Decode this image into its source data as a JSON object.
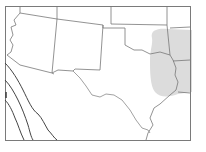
{
  "map": {
    "region": "Southwestern United States with Texas",
    "frame_color": "#7a7a7a",
    "border_color": "#6e6e6e",
    "shaded_region_color": "#d9d9d9",
    "background": "#ffffff",
    "features": [
      {
        "id": "state-borders",
        "label": "State borders"
      },
      {
        "id": "shaded-area",
        "label": "Shaded region (East Texas / Oklahoma / Arkansas / Louisiana border area)"
      },
      {
        "id": "river-line",
        "label": "Red River / Texas boundary"
      },
      {
        "id": "coastal-contours",
        "label": "Mexico west coast contour lines"
      }
    ]
  }
}
